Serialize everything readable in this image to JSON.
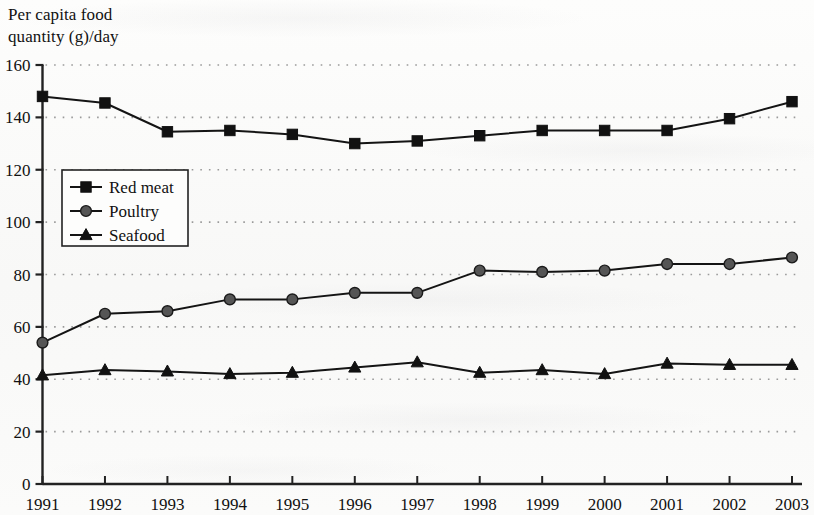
{
  "chart_data": {
    "type": "line",
    "title": "Per capita food\nquantity (g)/day",
    "title_line1": "Per capita food",
    "title_line2": "quantity (g)/day",
    "xlabel": "",
    "ylabel": "Per capita food quantity (g)/day",
    "x": [
      1991,
      1992,
      1993,
      1994,
      1995,
      1996,
      1997,
      1998,
      1999,
      2000,
      2001,
      2002,
      2003
    ],
    "categories": [
      "1991",
      "1992",
      "1993",
      "1994",
      "1995",
      "1996",
      "1997",
      "1998",
      "1999",
      "2000",
      "2001",
      "2002",
      "2003"
    ],
    "ylim": [
      0,
      160
    ],
    "yticks": [
      0,
      20,
      40,
      60,
      80,
      100,
      120,
      140,
      160
    ],
    "ytick_labels": [
      "0",
      "20",
      "40",
      "60",
      "80",
      "100",
      "120",
      "140",
      "160"
    ],
    "grid": "horizontal-dotted",
    "legend_position": "inner-left",
    "series": [
      {
        "name": "Red meat",
        "marker": "square",
        "color": "#111111",
        "values": [
          148,
          145.5,
          134.5,
          135,
          133.5,
          130,
          131,
          133,
          135,
          135,
          135,
          139.5,
          146
        ]
      },
      {
        "name": "Poultry",
        "marker": "circle",
        "color": "#555555",
        "values": [
          54,
          65,
          66,
          70.5,
          70.5,
          73,
          73,
          81.5,
          81,
          81.5,
          84,
          84,
          86.5
        ]
      },
      {
        "name": "Seafood",
        "marker": "triangle",
        "color": "#111111",
        "values": [
          41.5,
          43.5,
          43,
          42,
          42.5,
          44.5,
          46.5,
          42.5,
          43.5,
          42,
          46,
          45.5,
          45.5
        ]
      }
    ]
  },
  "legend": {
    "entries": [
      {
        "label": "Red meat",
        "marker": "square"
      },
      {
        "label": "Poultry",
        "marker": "circle"
      },
      {
        "label": "Seafood",
        "marker": "triangle"
      }
    ]
  },
  "colors": {
    "axis": "#222222",
    "grid": "#9a9a9a",
    "background": "#fbfbfa",
    "red_meat": "#111111",
    "poultry": "#555555",
    "seafood": "#111111"
  }
}
